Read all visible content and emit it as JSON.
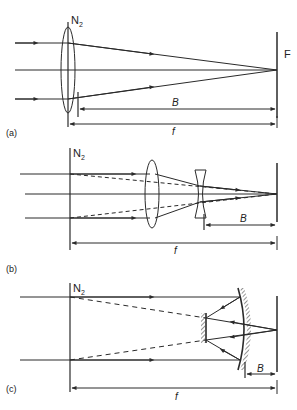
{
  "figure": {
    "colors": {
      "ink": "#2a2a2a",
      "background": "#ffffff"
    },
    "panels": [
      {
        "id": "a",
        "label": "(a)",
        "lens_label": "N",
        "lens_label_sub": "2",
        "focal_plane_label": "F",
        "back_focus_label": "B",
        "focal_length_label": "f",
        "elements": [
          "convex-lens",
          "focal-plane"
        ]
      },
      {
        "id": "b",
        "label": "(b)",
        "lens_label": "N",
        "lens_label_sub": "2",
        "back_focus_label": "B",
        "focal_length_label": "f",
        "elements": [
          "principal-plane",
          "convex-lens",
          "concave-lens",
          "focal-plane"
        ]
      },
      {
        "id": "c",
        "label": "(c)",
        "lens_label": "N",
        "lens_label_sub": "2",
        "back_focus_label": "B",
        "focal_length_label": "f",
        "elements": [
          "principal-plane",
          "primary-mirror",
          "secondary-mirror",
          "focal-plane"
        ]
      }
    ]
  }
}
